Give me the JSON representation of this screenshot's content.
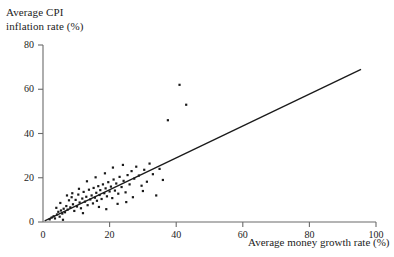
{
  "chart_data": {
    "type": "scatter",
    "title": "",
    "ylabel": "Average CPI\ninflation rate (%)",
    "ylabel_line1": "Average CPI",
    "ylabel_line2": "inflation rate (%)",
    "xlabel": "Average money growth rate (%)",
    "xlim": [
      0,
      100
    ],
    "ylim": [
      0,
      80
    ],
    "xticks": [
      0,
      20,
      40,
      60,
      80,
      100
    ],
    "yticks": [
      0,
      20,
      40,
      60,
      80
    ],
    "xtick_labels": [
      "0",
      "20",
      "40",
      "60",
      "80",
      "100"
    ],
    "ytick_labels": [
      "0",
      "20",
      "40",
      "60",
      "80"
    ],
    "grid": false,
    "legend": false,
    "marker": "square-dot",
    "marker_color": "#1a1a1a",
    "line_color": "#1a1a1a",
    "axis_color": "#6b6b6b",
    "fit_line": {
      "label": "45-degree fitted line",
      "x": [
        0.5,
        95.5
      ],
      "y": [
        0.5,
        69.0
      ]
    },
    "points": [
      {
        "x": 2.0,
        "y": 1.2
      },
      {
        "x": 2.6,
        "y": 2.0
      },
      {
        "x": 3.2,
        "y": 2.6
      },
      {
        "x": 3.6,
        "y": 1.6
      },
      {
        "x": 4.2,
        "y": 3.4
      },
      {
        "x": 4.6,
        "y": 4.6
      },
      {
        "x": 5.0,
        "y": 2.4
      },
      {
        "x": 5.4,
        "y": 5.2
      },
      {
        "x": 5.8,
        "y": 3.8
      },
      {
        "x": 6.2,
        "y": 6.0
      },
      {
        "x": 6.6,
        "y": 4.4
      },
      {
        "x": 7.0,
        "y": 7.2
      },
      {
        "x": 7.4,
        "y": 5.6
      },
      {
        "x": 7.8,
        "y": 9.8
      },
      {
        "x": 8.2,
        "y": 6.6
      },
      {
        "x": 8.6,
        "y": 11.2
      },
      {
        "x": 9.0,
        "y": 8.0
      },
      {
        "x": 9.4,
        "y": 5.0
      },
      {
        "x": 9.8,
        "y": 10.0
      },
      {
        "x": 10.2,
        "y": 7.0
      },
      {
        "x": 10.6,
        "y": 12.4
      },
      {
        "x": 11.0,
        "y": 8.8
      },
      {
        "x": 11.4,
        "y": 6.2
      },
      {
        "x": 11.8,
        "y": 10.6
      },
      {
        "x": 12.2,
        "y": 13.6
      },
      {
        "x": 12.6,
        "y": 9.2
      },
      {
        "x": 13.0,
        "y": 11.4
      },
      {
        "x": 13.4,
        "y": 7.6
      },
      {
        "x": 13.8,
        "y": 14.6
      },
      {
        "x": 14.2,
        "y": 10.2
      },
      {
        "x": 14.6,
        "y": 12.0
      },
      {
        "x": 15.0,
        "y": 8.4
      },
      {
        "x": 15.2,
        "y": 15.4
      },
      {
        "x": 15.6,
        "y": 11.0
      },
      {
        "x": 16.0,
        "y": 13.2
      },
      {
        "x": 16.2,
        "y": 9.6
      },
      {
        "x": 16.6,
        "y": 16.2
      },
      {
        "x": 17.0,
        "y": 12.2
      },
      {
        "x": 17.2,
        "y": 14.4
      },
      {
        "x": 17.6,
        "y": 10.4
      },
      {
        "x": 18.0,
        "y": 17.0
      },
      {
        "x": 18.4,
        "y": 13.0
      },
      {
        "x": 18.8,
        "y": 15.2
      },
      {
        "x": 19.2,
        "y": 11.6
      },
      {
        "x": 19.6,
        "y": 18.0
      },
      {
        "x": 20.0,
        "y": 13.8
      },
      {
        "x": 20.4,
        "y": 16.0
      },
      {
        "x": 20.8,
        "y": 10.8
      },
      {
        "x": 21.2,
        "y": 19.2
      },
      {
        "x": 21.6,
        "y": 14.2
      },
      {
        "x": 22.0,
        "y": 17.4
      },
      {
        "x": 22.6,
        "y": 12.8
      },
      {
        "x": 23.0,
        "y": 20.4
      },
      {
        "x": 23.6,
        "y": 15.8
      },
      {
        "x": 24.2,
        "y": 18.6
      },
      {
        "x": 24.8,
        "y": 13.4
      },
      {
        "x": 25.4,
        "y": 21.2
      },
      {
        "x": 26.0,
        "y": 17.0
      },
      {
        "x": 26.6,
        "y": 23.0
      },
      {
        "x": 27.4,
        "y": 19.6
      },
      {
        "x": 28.0,
        "y": 25.0
      },
      {
        "x": 28.8,
        "y": 21.0
      },
      {
        "x": 29.6,
        "y": 16.4
      },
      {
        "x": 30.4,
        "y": 23.6
      },
      {
        "x": 31.2,
        "y": 18.2
      },
      {
        "x": 32.0,
        "y": 26.4
      },
      {
        "x": 33.0,
        "y": 21.6
      },
      {
        "x": 34.0,
        "y": 12.0
      },
      {
        "x": 35.0,
        "y": 24.0
      },
      {
        "x": 36.0,
        "y": 19.0
      },
      {
        "x": 37.5,
        "y": 46.0
      },
      {
        "x": 41.0,
        "y": 62.0
      },
      {
        "x": 43.0,
        "y": 53.0
      },
      {
        "x": 6.0,
        "y": 1.0
      },
      {
        "x": 12.0,
        "y": 4.0
      },
      {
        "x": 16.8,
        "y": 6.8
      },
      {
        "x": 19.0,
        "y": 5.8
      },
      {
        "x": 22.4,
        "y": 8.2
      },
      {
        "x": 25.0,
        "y": 9.0
      },
      {
        "x": 27.0,
        "y": 11.2
      },
      {
        "x": 30.0,
        "y": 14.0
      },
      {
        "x": 24.0,
        "y": 25.8
      },
      {
        "x": 21.0,
        "y": 24.6
      },
      {
        "x": 18.6,
        "y": 22.0
      },
      {
        "x": 15.8,
        "y": 20.2
      },
      {
        "x": 13.2,
        "y": 18.4
      },
      {
        "x": 10.8,
        "y": 15.0
      },
      {
        "x": 8.8,
        "y": 13.0
      },
      {
        "x": 7.2,
        "y": 12.0
      },
      {
        "x": 5.2,
        "y": 8.6
      },
      {
        "x": 4.0,
        "y": 6.4
      }
    ]
  }
}
